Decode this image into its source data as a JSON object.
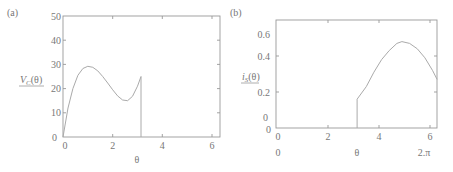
{
  "panels": [
    {
      "label": "(a)",
      "ylabel": "V_C(θ)",
      "ylabel_main": "V",
      "ylabel_sub": "C",
      "ylabel_arg": "(θ)",
      "xlabel": "θ",
      "xticks": [
        "0",
        "2",
        "4",
        "6"
      ],
      "yticks": [
        "0",
        "10",
        "20",
        "30",
        "40",
        "50"
      ]
    },
    {
      "label": "(b)",
      "ylabel": "i_S(θ)",
      "ylabel_main": "i",
      "ylabel_sub": "S",
      "ylabel_arg": "(θ)",
      "xlabel": "θ",
      "xticks": [
        "0",
        "2",
        "4",
        "6"
      ],
      "yticks": [
        "0",
        "0.2",
        "0.4",
        "0.6"
      ],
      "extra_x_labels": [
        "0",
        "2.π"
      ],
      "extra_y_label": "0"
    }
  ],
  "chart_data": [
    {
      "type": "line",
      "title": "(a)",
      "xlabel": "θ",
      "ylabel": "V_C(θ)",
      "xlim": [
        0,
        6.3
      ],
      "ylim": [
        0,
        50
      ],
      "grid": false,
      "x": [
        0,
        0.2,
        0.4,
        0.6,
        0.8,
        1.0,
        1.2,
        1.4,
        1.6,
        1.8,
        2.0,
        2.2,
        2.4,
        2.6,
        2.8,
        3.0,
        3.14,
        3.14
      ],
      "values": [
        0,
        12,
        20,
        25.5,
        28.3,
        29.2,
        28.8,
        27.3,
        25,
        22.3,
        19.5,
        17,
        15.3,
        15,
        16.8,
        21,
        25,
        0
      ]
    },
    {
      "type": "line",
      "title": "(b)",
      "xlabel": "θ",
      "ylabel": "i_S(θ)",
      "xlim": [
        0,
        6.3
      ],
      "ylim": [
        0,
        0.6
      ],
      "grid": false,
      "x": [
        3.14,
        3.14,
        3.5,
        3.8,
        4.1,
        4.4,
        4.7,
        4.9,
        5.2,
        5.5,
        5.8,
        6.1,
        6.28
      ],
      "values": [
        0,
        0.16,
        0.23,
        0.31,
        0.38,
        0.43,
        0.47,
        0.48,
        0.47,
        0.44,
        0.39,
        0.32,
        0.27
      ]
    }
  ]
}
